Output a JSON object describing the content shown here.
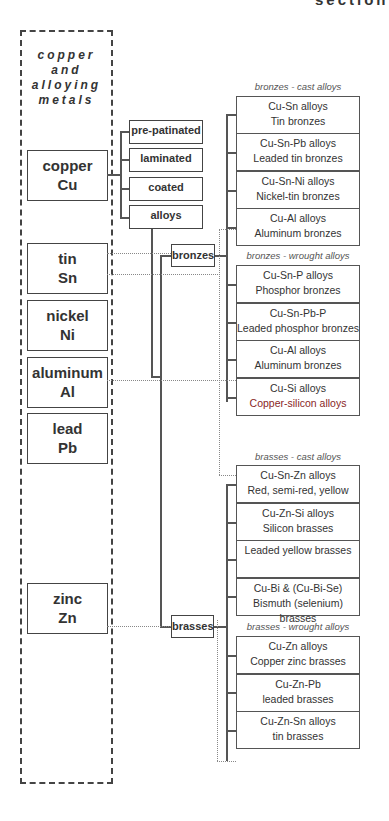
{
  "page": {
    "partial_header": "section"
  },
  "elements_panel": {
    "title_lines": [
      "copper",
      "and",
      "alloying",
      "metals"
    ],
    "elements": [
      {
        "name": "copper",
        "symbol": "Cu"
      },
      {
        "name": "tin",
        "symbol": "Sn"
      },
      {
        "name": "nickel",
        "symbol": "Ni"
      },
      {
        "name": "aluminum",
        "symbol": "Al"
      },
      {
        "name": "lead",
        "symbol": "Pb"
      },
      {
        "name": "zinc",
        "symbol": "Zn"
      }
    ]
  },
  "copper_forms": [
    "pre-patinated",
    "laminated",
    "coated",
    "alloys"
  ],
  "families": {
    "bronzes": "bronzes",
    "brasses": "brasses"
  },
  "groups": {
    "bronzes_cast": {
      "label": "bronzes - cast alloys",
      "items": [
        {
          "l1": "Cu-Sn alloys",
          "l2": "Tin bronzes"
        },
        {
          "l1": "Cu-Sn-Pb alloys",
          "l2": "Leaded tin bronzes"
        },
        {
          "l1": "Cu-Sn-Ni alloys",
          "l2": "Nickel-tin bronzes"
        },
        {
          "l1": "Cu-Al alloys",
          "l2": "Aluminum bronzes"
        }
      ]
    },
    "bronzes_wrought": {
      "label": "bronzes - wrought alloys",
      "items": [
        {
          "l1": "Cu-Sn-P alloys",
          "l2": "Phosphor bronzes"
        },
        {
          "l1": "Cu-Sn-Pb-P",
          "l2": "Leaded phosphor bronzes"
        },
        {
          "l1": "Cu-Al alloys",
          "l2": "Aluminum bronzes"
        },
        {
          "l1": "Cu-Si alloys",
          "l2": "Copper-silicon alloys"
        }
      ]
    },
    "brasses_cast": {
      "label": "brasses - cast alloys",
      "items": [
        {
          "l1": "Cu-Sn-Zn alloys",
          "l2": "Red, semi-red, yellow"
        },
        {
          "l1": "Cu-Zn-Si alloys",
          "l2": "Silicon brasses"
        },
        {
          "l1": "Leaded yellow brasses",
          "l2": ""
        },
        {
          "l1": "Cu-Bi & (Cu-Bi-Se)",
          "l2": "Bismuth (selenium) brasses"
        }
      ]
    },
    "brasses_wrought": {
      "label": "brasses - wrought alloys",
      "items": [
        {
          "l1": "Cu-Zn alloys",
          "l2": "Copper zinc brasses"
        },
        {
          "l1": "Cu-Zn-Pb",
          "l2": "leaded brasses"
        },
        {
          "l1": "Cu-Zn-Sn alloys",
          "l2": "tin brasses"
        }
      ]
    }
  },
  "colors": {
    "line": "#555555",
    "dotted": "#888888",
    "text": "#333333"
  }
}
